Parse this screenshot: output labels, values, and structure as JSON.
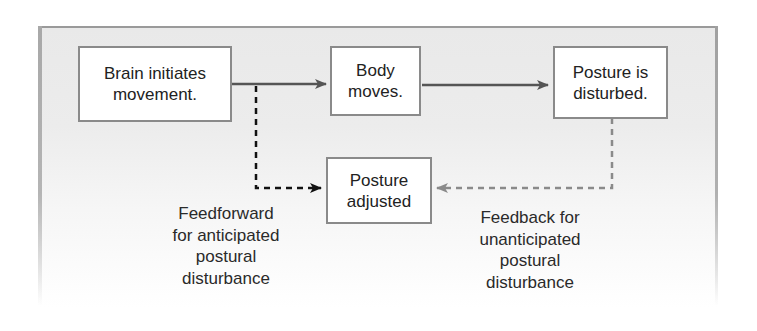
{
  "diagram": {
    "nodes": [
      {
        "id": "brain",
        "label": "Brain initiates\nmovement."
      },
      {
        "id": "body",
        "label": "Body\nmoves."
      },
      {
        "id": "disturbed",
        "label": "Posture is\ndisturbed."
      },
      {
        "id": "adjusted",
        "label": "Posture\nadjusted"
      }
    ],
    "edges": [
      {
        "from": "brain",
        "to": "body",
        "style": "solid",
        "color": "#555555"
      },
      {
        "from": "body",
        "to": "disturbed",
        "style": "solid",
        "color": "#555555"
      },
      {
        "from": "brain",
        "to": "adjusted",
        "style": "dashed",
        "color": "#111111",
        "label": "Feedforward\nfor anticipated\npostural\ndisturbance"
      },
      {
        "from": "disturbed",
        "to": "adjusted",
        "style": "dashed",
        "color": "#8a8a8a",
        "label": "Feedback for\nunanticipated\npostural\ndisturbance"
      }
    ]
  },
  "labels": {
    "feedforward": "Feedforward\nfor anticipated\npostural\ndisturbance",
    "feedback": "Feedback for\nunanticipated\npostural\ndisturbance"
  },
  "colors": {
    "solid_arrow": "#555555",
    "feedforward_arrow": "#111111",
    "feedback_arrow": "#8a8a8a",
    "box_border": "#8a8a8a",
    "panel_bg": "#ebebeb"
  }
}
